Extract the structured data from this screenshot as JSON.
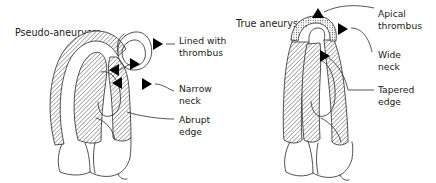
{
  "figure": {
    "background_color": "#ffffff",
    "ink_color": "#333333",
    "arrow_color": "#000000",
    "text_color": "#1a1a1a"
  },
  "panels": [
    {
      "id": "left",
      "title": "Pseudo-aneurysm",
      "annotations": [
        {
          "id": "lined-with-thrombus",
          "line1": "Lined with",
          "line2": "thrombus"
        },
        {
          "id": "narrow-neck",
          "line1": "Narrow",
          "line2": "neck"
        },
        {
          "id": "abrupt-edge",
          "line1": "Abrupt",
          "line2": "edge"
        }
      ]
    },
    {
      "id": "right",
      "title": "True aneurysm",
      "annotations": [
        {
          "id": "apical-thrombus",
          "line1": "Apical",
          "line2": "thrombus"
        },
        {
          "id": "wide-neck",
          "line1": "Wide",
          "line2": "neck"
        },
        {
          "id": "tapered-edge",
          "line1": "Tapered",
          "line2": "edge"
        }
      ]
    }
  ]
}
